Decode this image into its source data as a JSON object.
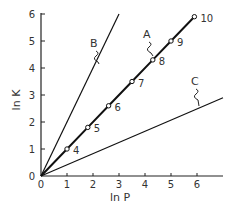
{
  "chart_data": {
    "type": "line",
    "title": "",
    "xlabel": "ln P",
    "ylabel": "ln K",
    "xlim": [
      0,
      7
    ],
    "ylim": [
      0,
      6
    ],
    "xticks": [
      0,
      1,
      2,
      3,
      4,
      5,
      6
    ],
    "yticks": [
      0,
      1,
      2,
      3,
      4,
      5,
      6
    ],
    "grid": false,
    "legend": null,
    "series": [
      {
        "name": "A",
        "style": "thick line with open circle markers",
        "x": [
          0,
          1.0,
          1.8,
          2.6,
          3.5,
          4.3,
          5.0,
          5.9
        ],
        "y": [
          0,
          1.0,
          1.8,
          2.6,
          3.5,
          4.3,
          5.0,
          5.9
        ],
        "point_labels": [
          "",
          "4",
          "5",
          "6",
          "7",
          "8",
          "9",
          "10"
        ]
      },
      {
        "name": "B",
        "style": "thin line",
        "x": [
          0,
          3.0
        ],
        "y": [
          0,
          6.0
        ]
      },
      {
        "name": "C",
        "style": "thin line",
        "x": [
          0,
          7.0
        ],
        "y": [
          0,
          2.9
        ]
      }
    ],
    "annotations": [
      {
        "text": "A",
        "x": 3.9,
        "y": 5.5
      },
      {
        "text": "B",
        "x": 1.85,
        "y": 5.0
      },
      {
        "text": "C",
        "x": 6.2,
        "y": 3.4
      }
    ]
  },
  "axes": {
    "x_label": "ln P",
    "y_label": "ln K",
    "x_ticks": [
      "0",
      "1",
      "2",
      "3",
      "4",
      "5",
      "6"
    ],
    "y_ticks": [
      "0",
      "1",
      "2",
      "3",
      "4",
      "5",
      "6"
    ]
  },
  "labels": {
    "a": "A",
    "b": "B",
    "c": "C"
  }
}
